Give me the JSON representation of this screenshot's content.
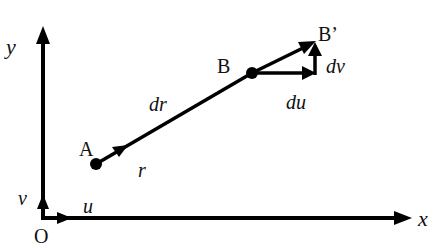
{
  "diagram": {
    "axes": {
      "x_label": "x",
      "y_label": "y",
      "origin_label": "O",
      "unit_x_label": "u",
      "unit_y_label": "v"
    },
    "points": [
      {
        "id": "A",
        "label": "A"
      },
      {
        "id": "B",
        "label": "B"
      },
      {
        "id": "B_prime",
        "label": "B’"
      }
    ],
    "vectors": {
      "position_label": "r",
      "displacement_label": "dr",
      "du_label": "du",
      "dv_label": "dv"
    },
    "colors": {
      "stroke": "#000000",
      "background": "#ffffff"
    }
  }
}
